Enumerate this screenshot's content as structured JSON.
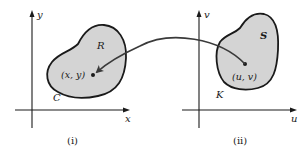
{
  "figure": {
    "background": "#ffffff",
    "region_fill": "#d4d4d4",
    "stroke": "#1a1a1a",
    "arrow_color": "#3a3a3a",
    "panels": [
      {
        "caption": "(i)",
        "axis_labels": {
          "horizontal": "x",
          "vertical": "y"
        },
        "region_label": "R",
        "boundary_label": "C",
        "point_label": "(x, y)"
      },
      {
        "caption": "(ii)",
        "axis_labels": {
          "horizontal": "u",
          "vertical": "v"
        },
        "region_label": "S",
        "boundary_label": "K",
        "point_label": "(u, v)"
      }
    ],
    "mapping_arrow": {
      "from": "(u, v)",
      "to": "(x, y)"
    }
  }
}
